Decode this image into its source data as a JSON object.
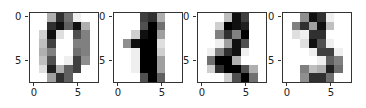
{
  "chart_data": [
    {
      "type": "heatmap",
      "title": "",
      "colormap": "gray_r",
      "vmin": 0,
      "vmax": 16,
      "xticks": [
        "0",
        "5"
      ],
      "yticks": [
        "0",
        "5"
      ],
      "values": [
        [
          0,
          0,
          5,
          13,
          9,
          1,
          0,
          0
        ],
        [
          0,
          0,
          13,
          15,
          10,
          15,
          5,
          0
        ],
        [
          0,
          3,
          15,
          2,
          0,
          11,
          8,
          0
        ],
        [
          0,
          4,
          12,
          0,
          0,
          8,
          8,
          0
        ],
        [
          0,
          5,
          8,
          0,
          0,
          9,
          8,
          0
        ],
        [
          0,
          4,
          11,
          0,
          1,
          12,
          7,
          0
        ],
        [
          0,
          2,
          14,
          5,
          10,
          12,
          0,
          0
        ],
        [
          0,
          0,
          6,
          13,
          10,
          0,
          0,
          0
        ]
      ]
    },
    {
      "type": "heatmap",
      "title": "",
      "colormap": "gray_r",
      "vmin": 0,
      "vmax": 16,
      "xticks": [
        "0",
        "5"
      ],
      "yticks": [
        "0",
        "5"
      ],
      "values": [
        [
          0,
          0,
          0,
          12,
          13,
          5,
          0,
          0
        ],
        [
          0,
          0,
          0,
          11,
          16,
          9,
          0,
          0
        ],
        [
          0,
          0,
          3,
          15,
          16,
          6,
          0,
          0
        ],
        [
          0,
          7,
          15,
          16,
          16,
          2,
          0,
          0
        ],
        [
          0,
          0,
          1,
          16,
          16,
          3,
          0,
          0
        ],
        [
          0,
          0,
          1,
          16,
          16,
          6,
          0,
          0
        ],
        [
          0,
          0,
          1,
          16,
          16,
          6,
          0,
          0
        ],
        [
          0,
          0,
          0,
          11,
          16,
          10,
          0,
          0
        ]
      ]
    },
    {
      "type": "heatmap",
      "title": "",
      "colormap": "gray_r",
      "vmin": 0,
      "vmax": 16,
      "xticks": [
        "0",
        "5"
      ],
      "yticks": [
        "0",
        "5"
      ],
      "values": [
        [
          0,
          0,
          0,
          4,
          15,
          12,
          0,
          0
        ],
        [
          0,
          0,
          3,
          16,
          15,
          14,
          0,
          0
        ],
        [
          0,
          0,
          8,
          13,
          8,
          16,
          0,
          0
        ],
        [
          0,
          0,
          1,
          6,
          15,
          11,
          0,
          0
        ],
        [
          0,
          1,
          8,
          13,
          15,
          1,
          0,
          0
        ],
        [
          0,
          9,
          16,
          16,
          5,
          0,
          0,
          0
        ],
        [
          0,
          3,
          13,
          16,
          16,
          11,
          5,
          0
        ],
        [
          0,
          0,
          0,
          3,
          11,
          16,
          9,
          0
        ]
      ]
    },
    {
      "type": "heatmap",
      "title": "",
      "colormap": "gray_r",
      "vmin": 0,
      "vmax": 16,
      "xticks": [
        "0",
        "5"
      ],
      "yticks": [
        "0",
        "5"
      ],
      "values": [
        [
          0,
          0,
          7,
          15,
          13,
          1,
          0,
          0
        ],
        [
          0,
          8,
          13,
          6,
          15,
          4,
          0,
          0
        ],
        [
          0,
          2,
          1,
          13,
          13,
          0,
          0,
          0
        ],
        [
          0,
          0,
          2,
          15,
          11,
          1,
          0,
          0
        ],
        [
          0,
          0,
          0,
          1,
          12,
          12,
          1,
          0
        ],
        [
          0,
          0,
          0,
          0,
          1,
          10,
          8,
          0
        ],
        [
          0,
          0,
          8,
          4,
          5,
          14,
          9,
          0
        ],
        [
          0,
          0,
          7,
          13,
          13,
          9,
          0,
          0
        ]
      ]
    }
  ],
  "panels": [
    {
      "left": 29,
      "ytick0": "0",
      "ytick5": "5",
      "xtick0": "0",
      "xtick5": "5"
    },
    {
      "left": 113,
      "ytick0": "0",
      "ytick5": "5",
      "xtick0": "0",
      "xtick5": "5"
    },
    {
      "left": 197,
      "ytick0": "0",
      "ytick5": "5",
      "xtick0": "0",
      "xtick5": "5"
    },
    {
      "left": 282,
      "ytick0": "0",
      "ytick5": "5",
      "xtick0": "0",
      "xtick5": "5"
    }
  ]
}
